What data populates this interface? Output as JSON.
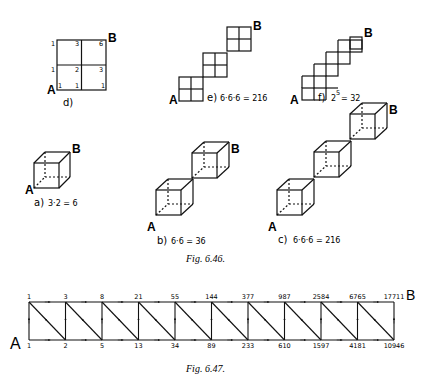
{
  "fig_6_46": {
    "caption": "Fig. 6.46.",
    "a": {
      "letter": "a)",
      "formula": "3·2 = 6",
      "start": "A",
      "end": "B"
    },
    "b": {
      "letter": "b)",
      "formula": "6·6 = 36",
      "start": "A",
      "end": "B"
    },
    "c": {
      "letter": "c)",
      "formula": "6·6·6 = 216",
      "start": "A",
      "end": "B"
    },
    "d": {
      "letter": "d)",
      "start": "A",
      "end": "B",
      "grid_values": {
        "top": [
          "1",
          "3",
          "6"
        ],
        "middle": [
          "1",
          "2",
          "3"
        ],
        "bottom": [
          "1",
          "1",
          "1"
        ]
      }
    },
    "e": {
      "letter": "e)",
      "formula": "6·6·6 = 216",
      "start": "A",
      "end": "B"
    },
    "f": {
      "letter": "f)",
      "formula": "2",
      "exponent": "5",
      "result": "= 32",
      "start": "A",
      "end": "B"
    }
  },
  "fig_6_47": {
    "caption": "Fig. 6.47.",
    "start": "A",
    "end": "B",
    "top_values": [
      "1",
      "3",
      "8",
      "21",
      "55",
      "144",
      "377",
      "987",
      "2584",
      "6765",
      "17711"
    ],
    "bottom_values": [
      "1",
      "2",
      "5",
      "13",
      "34",
      "89",
      "233",
      "610",
      "1597",
      "4181",
      "10946"
    ]
  }
}
